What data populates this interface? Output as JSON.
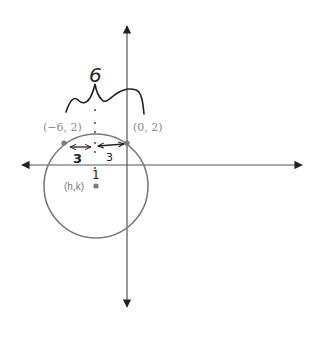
{
  "diagram": {
    "type": "coordinate-plane-circle",
    "points": [
      {
        "label": "(−6, 2)",
        "x": -6,
        "y": 2
      },
      {
        "label": "(0, 2)",
        "x": 0,
        "y": 2
      }
    ],
    "center": {
      "label": "(h,k)"
    },
    "annotations": {
      "chord_length": "6",
      "left_half": "3",
      "right_half": "3",
      "tick_mark": "1"
    },
    "colors": {
      "axis": "#555555",
      "circle": "#7a7a7a",
      "point": "#7a7a7a",
      "ink": "#222222"
    }
  }
}
